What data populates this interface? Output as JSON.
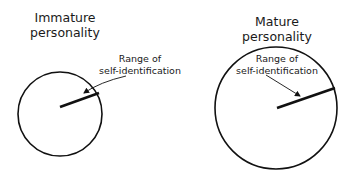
{
  "left_panel": {
    "title_line1": "Immature",
    "title_line2": "personality",
    "label_line1": "Range of",
    "label_line2": "self-identification"
  },
  "right_panel": {
    "title_line1": "Mature",
    "title_line2": "personality",
    "label_line1": "Range of",
    "label_line2": "self-identification"
  },
  "colors": {
    "stroke": "#111111",
    "background": "#ffffff"
  }
}
